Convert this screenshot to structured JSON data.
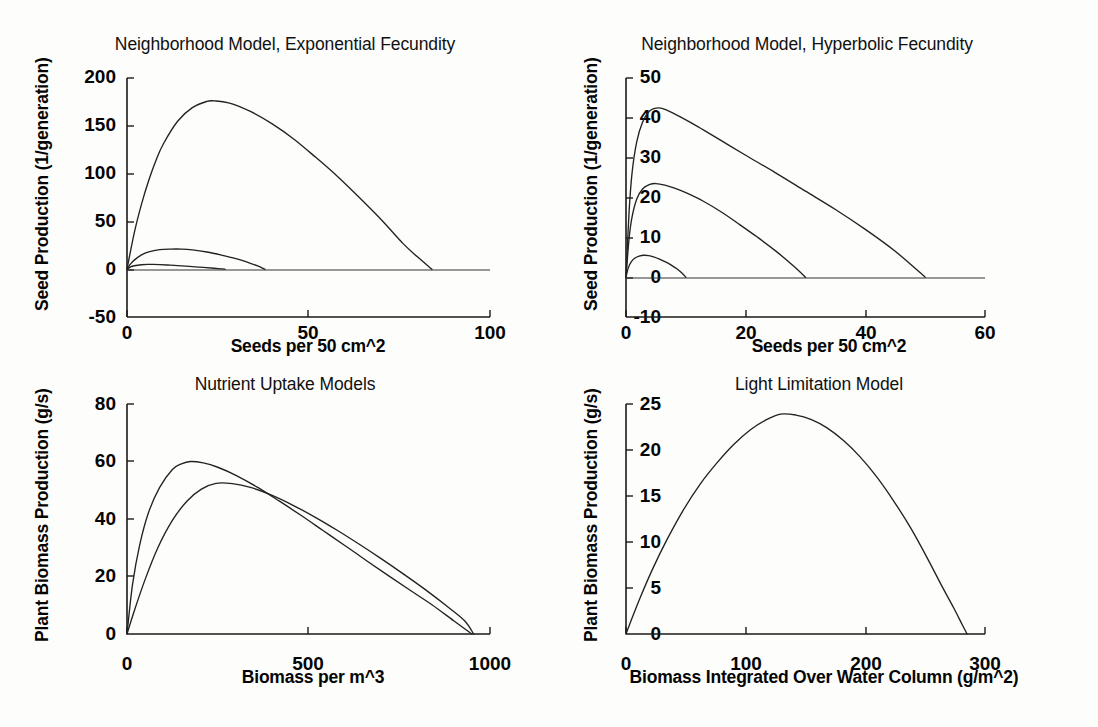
{
  "figure": {
    "background_color": "#fdfdfb",
    "line_color": "#222222",
    "axis_color": "#1a1a1a",
    "panel_count": 4
  },
  "chart_data": [
    {
      "id": "neighborhood-exponential",
      "type": "line",
      "title": "Neighborhood Model, Exponential Fecundity",
      "xlabel": "Seeds per 50 cm^2",
      "ylabel": "Seed Production (1/generation)",
      "xlim": [
        0,
        100
      ],
      "ylim": [
        -50,
        200
      ],
      "xticks": [
        0,
        50,
        100
      ],
      "xticklabels": [
        "0",
        "50",
        "100"
      ],
      "yticks": [
        -50,
        0,
        50,
        100,
        150,
        200
      ],
      "yticklabels": [
        "-50",
        "0",
        "50",
        "100",
        "150",
        "200"
      ],
      "grid": false,
      "legend": "none",
      "series": [
        {
          "name": "high fecundity",
          "peak_x": 24,
          "peak_y": 176,
          "zero_crossing_x": 84,
          "x": [
            0,
            2,
            4,
            6,
            8,
            10,
            14,
            18,
            22,
            24,
            28,
            34,
            40,
            46,
            52,
            58,
            64,
            70,
            76,
            80,
            84
          ],
          "values": [
            0,
            38,
            68,
            93,
            114,
            131,
            155,
            169,
            175.5,
            176,
            174,
            165,
            152,
            136,
            117,
            97,
            75,
            52,
            27,
            13,
            0
          ]
        },
        {
          "name": "medium fecundity",
          "peak_x": 15,
          "peak_y": 21,
          "zero_crossing_x": 38,
          "x": [
            0,
            1,
            2,
            4,
            6,
            9,
            12,
            15,
            18,
            22,
            26,
            30,
            34,
            36,
            38
          ],
          "values": [
            0,
            5.5,
            9.5,
            15,
            18.2,
            20.4,
            21,
            21,
            20.2,
            18,
            14.8,
            11,
            6.2,
            3.4,
            0
          ]
        },
        {
          "name": "low fecundity",
          "peak_x": 7,
          "peak_y": 5,
          "zero_crossing_x": 27,
          "x": [
            0,
            1,
            2,
            4,
            6,
            7,
            9,
            12,
            15,
            18,
            21,
            24,
            27
          ],
          "values": [
            0,
            2.4,
            3.6,
            4.7,
            5.0,
            5.0,
            4.8,
            4.2,
            3.5,
            2.7,
            1.9,
            1.0,
            0
          ]
        }
      ]
    },
    {
      "id": "neighborhood-hyperbolic",
      "type": "line",
      "title": "Neighborhood Model, Hyperbolic Fecundity",
      "xlabel": "Seeds per 50 cm^2",
      "ylabel": "Seed Production (1/generation)",
      "xlim": [
        0,
        60
      ],
      "ylim": [
        -10,
        50
      ],
      "xticks": [
        0,
        20,
        40,
        60
      ],
      "xticklabels": [
        "0",
        "20",
        "40",
        "60"
      ],
      "yticks": [
        -10,
        0,
        10,
        20,
        30,
        40,
        50
      ],
      "yticklabels": [
        "-10",
        "0",
        "10",
        "20",
        "30",
        "40",
        "50"
      ],
      "grid": false,
      "legend": "none",
      "series": [
        {
          "name": "high fecundity",
          "peak_x": 5.5,
          "peak_y": 42.5,
          "zero_crossing_x": 50,
          "x": [
            0,
            0.5,
            1,
            1.8,
            2.8,
            4,
            5.5,
            7,
            9,
            12,
            16,
            20,
            25,
            30,
            35,
            40,
            45,
            50
          ],
          "values": [
            0,
            16,
            26,
            34,
            39,
            41.8,
            42.5,
            41.8,
            40.3,
            37.8,
            34.2,
            30.6,
            26.2,
            21.6,
            17.0,
            12.0,
            6.5,
            0
          ]
        },
        {
          "name": "medium fecundity",
          "peak_x": 5,
          "peak_y": 23.5,
          "zero_crossing_x": 30,
          "x": [
            0,
            0.5,
            1,
            1.8,
            2.8,
            4,
            5,
            6.5,
            8,
            10,
            13,
            16,
            19,
            22,
            25,
            28,
            30
          ],
          "values": [
            0,
            9.5,
            15,
            19.6,
            22.2,
            23.3,
            23.5,
            23.1,
            22.4,
            21.2,
            19.0,
            16.3,
            13.2,
            10.0,
            6.6,
            2.8,
            0
          ]
        },
        {
          "name": "low fecundity",
          "peak_x": 3,
          "peak_y": 5.5,
          "zero_crossing_x": 10,
          "x": [
            0,
            0.4,
            0.9,
            1.5,
            2.2,
            3,
            3.8,
            4.6,
            5.5,
            6.5,
            7.5,
            8.5,
            9.3,
            10
          ],
          "values": [
            0,
            2.4,
            3.9,
            4.8,
            5.3,
            5.5,
            5.4,
            5.1,
            4.6,
            3.9,
            3.1,
            2.1,
            1.1,
            0
          ]
        }
      ]
    },
    {
      "id": "nutrient-uptake",
      "type": "line",
      "title": "Nutrient Uptake Models",
      "xlabel": "Biomass per m^3",
      "ylabel": "Plant Biomass Production (g/s)",
      "xlim": [
        0,
        1000
      ],
      "ylim": [
        0,
        80
      ],
      "xticks": [
        0,
        500,
        1000
      ],
      "xticklabels": [
        "0",
        "500",
        "1000"
      ],
      "yticks": [
        0,
        20,
        40,
        60,
        80
      ],
      "yticklabels": [
        "0",
        "20",
        "40",
        "60",
        "80"
      ],
      "grid": false,
      "legend": "none",
      "series": [
        {
          "name": "model 1",
          "peak_x": 175,
          "peak_y": 60,
          "zero_crossing_x": 950,
          "x": [
            0,
            15,
            35,
            60,
            90,
            125,
            150,
            175,
            210,
            250,
            300,
            360,
            420,
            480,
            540,
            600,
            660,
            720,
            780,
            840,
            900,
            950
          ],
          "values": [
            0,
            17,
            31,
            42.5,
            51,
            57.2,
            59.2,
            60.0,
            59.5,
            58.0,
            55.2,
            51.0,
            46.2,
            41.2,
            36.0,
            30.8,
            25.5,
            20.3,
            15.2,
            10.2,
            4.6,
            0
          ]
        },
        {
          "name": "model 2",
          "peak_x": 245,
          "peak_y": 52.5,
          "zero_crossing_x": 955,
          "x": [
            0,
            20,
            50,
            85,
            125,
            165,
            205,
            245,
            290,
            340,
            400,
            460,
            520,
            580,
            640,
            700,
            760,
            820,
            880,
            930,
            955
          ],
          "values": [
            0,
            8,
            19,
            30,
            39.5,
            46.2,
            50.4,
            52.4,
            52.3,
            51.0,
            48.2,
            44.6,
            40.5,
            36.0,
            31.2,
            26.2,
            21.0,
            15.6,
            9.8,
            4.6,
            0
          ]
        }
      ]
    },
    {
      "id": "light-limitation",
      "type": "line",
      "title": "Light Limitation Model",
      "xlabel": "Biomass Integrated Over Water Column (g/m^2)",
      "ylabel": "Plant Biomass Production (g/s)",
      "xlim": [
        0,
        300
      ],
      "ylim": [
        0,
        25
      ],
      "xticks": [
        0,
        100,
        200,
        300
      ],
      "xticklabels": [
        "0",
        "100",
        "200",
        "300"
      ],
      "yticks": [
        0,
        5,
        10,
        15,
        20,
        25
      ],
      "yticklabels": [
        "0",
        "5",
        "10",
        "15",
        "20",
        "25"
      ],
      "grid": false,
      "legend": "none",
      "series": [
        {
          "name": "light limited production",
          "peak_x": 129,
          "peak_y": 23.9,
          "zero_crossing_x": 285,
          "x": [
            0,
            5,
            12,
            22,
            34,
            48,
            62,
            76,
            90,
            104,
            116,
            129,
            142,
            155,
            168,
            182,
            196,
            210,
            224,
            238,
            252,
            264,
            274,
            281,
            285
          ],
          "values": [
            0,
            1.7,
            4.0,
            7.0,
            10.2,
            13.5,
            16.3,
            18.6,
            20.6,
            22.2,
            23.2,
            23.9,
            23.8,
            23.3,
            22.4,
            21.0,
            19.2,
            17.0,
            14.4,
            11.5,
            8.2,
            5.2,
            2.8,
            1.0,
            0
          ]
        }
      ]
    }
  ]
}
